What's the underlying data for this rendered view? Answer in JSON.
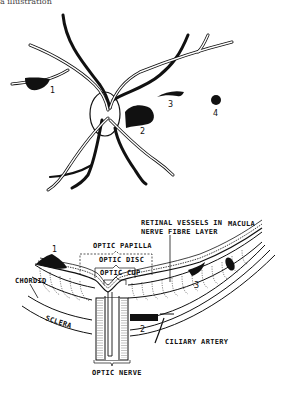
{
  "header": {
    "cut_text": "a illustration"
  },
  "fundus_view": {
    "lesion_labels": [
      "1",
      "2",
      "3",
      "4"
    ]
  },
  "cross_section": {
    "labels": {
      "retinal_vessels_line1": "RETINAL VESSELS IN",
      "retinal_vessels_line2": "NERVE FIBRE LAYER",
      "macula": "MACULA",
      "optic_papilla": "OPTIC PAPILLA",
      "optic_disc": "OPTIC DISC",
      "optic_cup": "OPTIC CUP",
      "chorioid": "CHORDID",
      "sclera": "SCLERA",
      "ciliary_artery": "CILIARY ARTERY",
      "optic_nerve": "OPTIC NERVE"
    },
    "lesion_labels": [
      "1",
      "2",
      "3"
    ]
  },
  "colors": {
    "ink": "#111111",
    "background": "#ffffff"
  }
}
